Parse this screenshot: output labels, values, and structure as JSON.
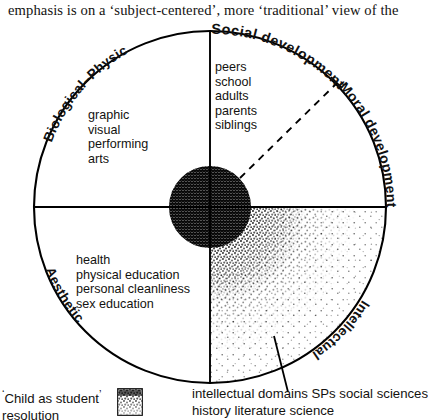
{
  "running_text": "emphasis is on a ‘subject-centered’, more ‘traditional’ view of the",
  "diagram": {
    "name": "child-as-student-resolution-wheel",
    "center": {
      "x": 210,
      "y": 207
    },
    "radius": 176,
    "stroke_color": "#000000",
    "fill_color": "#ffffff",
    "arc_labels": [
      {
        "id": "social-development",
        "text": "Social development",
        "quadrant": "top-right-arc"
      },
      {
        "id": "moral-development",
        "text": "Moral development",
        "quadrant": "right-upper-arc"
      },
      {
        "id": "intellectual",
        "text": "Intellectual",
        "quadrant": "right-lower-arc"
      },
      {
        "id": "biological-physical",
        "text": "Biological–Physical",
        "quadrant": "left-lower-arc"
      },
      {
        "id": "aesthetic",
        "text": "Aesthetic",
        "quadrant": "left-upper-arc"
      }
    ],
    "quadrant_lists": [
      {
        "id": "aesthetic-items",
        "quadrant": "upper-left",
        "items": [
          "graphic",
          "visual",
          "performing",
          "arts"
        ]
      },
      {
        "id": "social-items",
        "quadrant": "upper-right",
        "items": [
          "peers",
          "school",
          "adults",
          "parents",
          "siblings"
        ]
      },
      {
        "id": "biological-physical-items",
        "quadrant": "lower-left",
        "items": [
          "health",
          "physical education",
          "personal cleanliness",
          "sex education"
        ]
      }
    ],
    "core_blob": {
      "id": "central-dense-core",
      "cx": 210,
      "cy": 207,
      "r": 41,
      "shading": "cross-hatch-dense"
    },
    "stipple_field": {
      "id": "intellectual-stipple",
      "quadrant": "lower-right",
      "shading": "radial-stipple-fading-outward"
    },
    "dashed_ray": {
      "id": "dashed-radius-upper-right",
      "from": {
        "x": 238,
        "y": 180
      },
      "to": {
        "x": 335,
        "y": 84
      },
      "style": "dashed"
    },
    "pointer_line": {
      "id": "caption-pointer-line",
      "from": {
        "x": 285,
        "y": 388
      },
      "to": {
        "x": 276,
        "y": 340
      }
    }
  },
  "captions": {
    "left": {
      "line1": "Child as student",
      "line2": "resolution",
      "open_mark": "‘",
      "close_mark": "’"
    },
    "right": {
      "line1": "intellectual domains SPs social sciences",
      "line2": "history literature science"
    }
  },
  "legend": {
    "swatch_id": "stipple-density-swatch",
    "description": "stipple density key"
  }
}
